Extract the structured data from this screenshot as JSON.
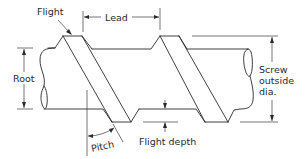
{
  "figure": {
    "labels": {
      "flight": "Flight",
      "lead": "Lead",
      "root": "Root",
      "screw_outside_dia_line1": "Screw",
      "screw_outside_dia_line2": "outside",
      "screw_outside_dia_line3": "dia.",
      "pitch": "Pitch",
      "flight_depth": "Flight depth"
    },
    "colors": {
      "line": "#2a2a2a",
      "background": "#ffffff"
    }
  }
}
